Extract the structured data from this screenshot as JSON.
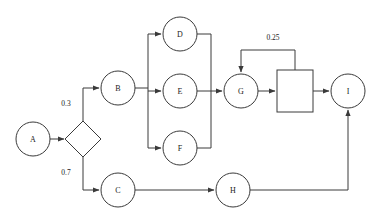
{
  "diagram": {
    "type": "flowchart",
    "canvas": {
      "width": 383,
      "height": 221,
      "background": "#ffffff"
    },
    "stroke_color": "#3a3a3a",
    "text_color": "#1a1a1a",
    "nodes": [
      {
        "id": "A",
        "label": "A",
        "shape": "circle",
        "cx": 33,
        "cy": 139,
        "r": 17
      },
      {
        "id": "DECISION",
        "label": "",
        "shape": "diamond",
        "cx": 83,
        "cy": 139,
        "r": 18
      },
      {
        "id": "B",
        "label": "B",
        "shape": "circle",
        "cx": 118,
        "cy": 88,
        "r": 17
      },
      {
        "id": "C",
        "label": "C",
        "shape": "circle",
        "cx": 118,
        "cy": 190,
        "r": 17
      },
      {
        "id": "D",
        "label": "D",
        "shape": "circle",
        "cx": 180,
        "cy": 34,
        "r": 17
      },
      {
        "id": "E",
        "label": "E",
        "shape": "circle",
        "cx": 180,
        "cy": 91,
        "r": 17
      },
      {
        "id": "F",
        "label": "F",
        "shape": "circle",
        "cx": 180,
        "cy": 148,
        "r": 17
      },
      {
        "id": "G",
        "label": "G",
        "shape": "circle",
        "cx": 241,
        "cy": 91,
        "r": 17
      },
      {
        "id": "BOX",
        "label": "",
        "shape": "square",
        "x": 277,
        "y": 70,
        "width": 36,
        "height": 42
      },
      {
        "id": "H",
        "label": "H",
        "shape": "circle",
        "cx": 233,
        "cy": 190,
        "r": 17
      },
      {
        "id": "I",
        "label": "I",
        "shape": "circle",
        "cx": 348,
        "cy": 91,
        "r": 17
      }
    ],
    "edges": [
      {
        "id": "a-to-decision",
        "from": "A",
        "to": "DECISION",
        "points": "50,139 64,139",
        "arrow": true
      },
      {
        "id": "decision-to-b",
        "from": "DECISION",
        "to": "B",
        "points": "83,121 83,88 99,88",
        "arrow": true
      },
      {
        "id": "decision-to-c",
        "from": "DECISION",
        "to": "C",
        "points": "83,157 83,190 99,190",
        "arrow": true
      },
      {
        "id": "b-to-bus",
        "from": "B",
        "to": "fanout-bus",
        "points": "135,88 148,88",
        "arrow": false
      },
      {
        "id": "bus-vertical",
        "from": "fanout-bus",
        "to": "fanout-bus",
        "points": "148,34 148,148",
        "arrow": false
      },
      {
        "id": "bus-to-d",
        "from": "fanout-bus",
        "to": "D",
        "points": "148,34 161,34",
        "arrow": true
      },
      {
        "id": "bus-to-e",
        "from": "fanout-bus",
        "to": "E",
        "points": "148,91 161,91",
        "arrow": true
      },
      {
        "id": "bus-to-f",
        "from": "fanout-bus",
        "to": "F",
        "points": "148,148 161,148",
        "arrow": true
      },
      {
        "id": "d-to-merge",
        "from": "D",
        "to": "merge-bus",
        "points": "197,34 211,34",
        "arrow": false
      },
      {
        "id": "f-to-merge",
        "from": "F",
        "to": "merge-bus",
        "points": "197,148 211,148",
        "arrow": false
      },
      {
        "id": "merge-vertical",
        "from": "merge-bus",
        "to": "merge-bus",
        "points": "211,34 211,148",
        "arrow": false
      },
      {
        "id": "e-to-g",
        "from": "E",
        "to": "G",
        "points": "197,91 222,91",
        "arrow": true
      },
      {
        "id": "g-to-box",
        "from": "G",
        "to": "BOX",
        "points": "258,91 275,91",
        "arrow": true
      },
      {
        "id": "box-feedback",
        "from": "BOX",
        "to": "G",
        "points": "295,70 295,50 241,50 241,72",
        "arrow": true
      },
      {
        "id": "box-to-i",
        "from": "BOX",
        "to": "I",
        "points": "313,91 329,91",
        "arrow": true
      },
      {
        "id": "c-to-h",
        "from": "C",
        "to": "H",
        "points": "135,190 214,190",
        "arrow": true
      },
      {
        "id": "h-to-i",
        "from": "H",
        "to": "I",
        "points": "250,190 348,190 348,110",
        "arrow": true
      }
    ],
    "edge_labels": [
      {
        "id": "label-0-3",
        "text": "0.3",
        "x": 66,
        "y": 103,
        "edge": "decision-to-b"
      },
      {
        "id": "label-0-7",
        "text": "0.7",
        "x": 66,
        "y": 172,
        "edge": "decision-to-c"
      },
      {
        "id": "label-0-25",
        "text": "0.25",
        "x": 273,
        "y": 37,
        "edge": "box-feedback"
      }
    ]
  }
}
